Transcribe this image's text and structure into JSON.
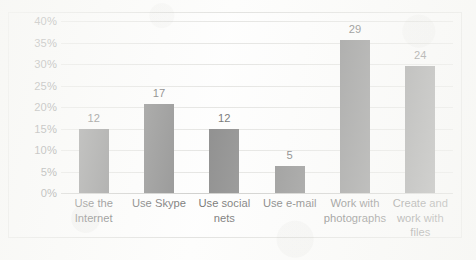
{
  "chart_data": {
    "type": "bar",
    "title": "",
    "subtitle": "",
    "xlabel": "",
    "ylabel": "",
    "categories": [
      "Use the Internet",
      "Use Skype",
      "Use social nets",
      "Use e-mail",
      "Work with photographs",
      "Create and work with files"
    ],
    "series": [
      {
        "name": "",
        "values": [
          14.8,
          20.8,
          15.0,
          6.2,
          35.5,
          29.5
        ],
        "data_labels": [
          "12",
          "17",
          "12",
          "5",
          "29",
          "24"
        ]
      }
    ],
    "ylim": [
      0,
      40
    ],
    "ytick_step": 5,
    "ytick_labels": [
      "0%",
      "5%",
      "10%",
      "15%",
      "20%",
      "25%",
      "30%",
      "35%",
      "40%"
    ],
    "ytick_values": [
      0,
      5,
      10,
      15,
      20,
      25,
      30,
      35,
      40
    ],
    "grid": "horizontal",
    "legend": "none",
    "bar_color": "#595959",
    "gridline_color": "#d9d9d6",
    "axis_color": "#b9b9b6",
    "border_color": "#d5d5d2",
    "plot_background": "#fefefe"
  }
}
